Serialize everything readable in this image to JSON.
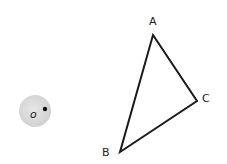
{
  "diagram": {
    "background": "#ffffff",
    "stroke_color": "#1a1a1a",
    "triangle": {
      "vertices": {
        "A": {
          "x": 153,
          "y": 35
        },
        "B": {
          "x": 120,
          "y": 152
        },
        "C": {
          "x": 197,
          "y": 101
        }
      },
      "labels": {
        "A": "A",
        "B": "B",
        "C": "C"
      }
    },
    "circle": {
      "center": {
        "x": 35,
        "y": 111
      },
      "radius": 16,
      "fill": "#d9d9d9",
      "label": "o",
      "point": {
        "x": 45,
        "y": 109
      }
    }
  }
}
